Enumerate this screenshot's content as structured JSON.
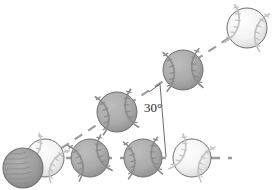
{
  "figure": {
    "type": "projectile-trajectory-diagram",
    "background_color": "#ffffff",
    "width": 277,
    "height": 190,
    "annotations": {
      "angle_label": "30°"
    },
    "colors": {
      "ball_light_fill": "#f2f2f2",
      "ball_gray_fill": "#a9a9a9",
      "ball_dark_fill": "#9a9a9a",
      "ball_outline": "#6f6f6f",
      "seam_light": "#b9b9b9",
      "seam_gray": "#8a8a8a",
      "dash_line": "#9b9b9b",
      "angle_line": "#5a5a5a",
      "text": "#2b2b2b"
    },
    "trajectory_line": {
      "name": "launch-path-dashed-line",
      "style": "dashed",
      "from": [
        48,
        157
      ],
      "to": [
        241,
        30
      ],
      "angle_degrees": 30
    },
    "horizontal_line": {
      "name": "horizontal-reference-dashed-line",
      "style": "dashed",
      "from": [
        48,
        158
      ],
      "to": [
        232,
        158
      ]
    },
    "angle_marker": {
      "vertex": [
        160,
        84
      ],
      "ray_along_path_end": [
        150,
        91
      ],
      "ray_vertical_end": [
        166,
        157
      ],
      "label": "30°",
      "label_x": 147,
      "label_y": 108
    },
    "balls": [
      {
        "name": "ball-launch-dark",
        "cx": 23,
        "cy": 168,
        "r": 20,
        "shade": "dark",
        "seam_style": "hatch",
        "order": 0
      },
      {
        "name": "ball-launch-light",
        "cx": 45,
        "cy": 158,
        "r": 19,
        "shade": "light",
        "seam_style": "seams",
        "order": 1
      },
      {
        "name": "ball-path-1",
        "cx": 117,
        "cy": 112,
        "r": 20,
        "shade": "gray",
        "seam_style": "seams",
        "order": 2
      },
      {
        "name": "ball-path-2",
        "cx": 183,
        "cy": 70,
        "r": 20,
        "shade": "gray",
        "seam_style": "seams",
        "order": 3
      },
      {
        "name": "ball-path-3-top",
        "cx": 247,
        "cy": 28,
        "r": 20,
        "shade": "light",
        "seam_style": "seams",
        "order": 4
      },
      {
        "name": "ball-horizontal-1",
        "cx": 90,
        "cy": 158,
        "r": 19,
        "shade": "gray",
        "seam_style": "seams",
        "order": 5
      },
      {
        "name": "ball-horizontal-2",
        "cx": 143,
        "cy": 158,
        "r": 19,
        "shade": "gray",
        "seam_style": "seams",
        "order": 6
      },
      {
        "name": "ball-horizontal-3",
        "cx": 192,
        "cy": 158,
        "r": 19,
        "shade": "light",
        "seam_style": "seams",
        "order": 7
      }
    ]
  }
}
